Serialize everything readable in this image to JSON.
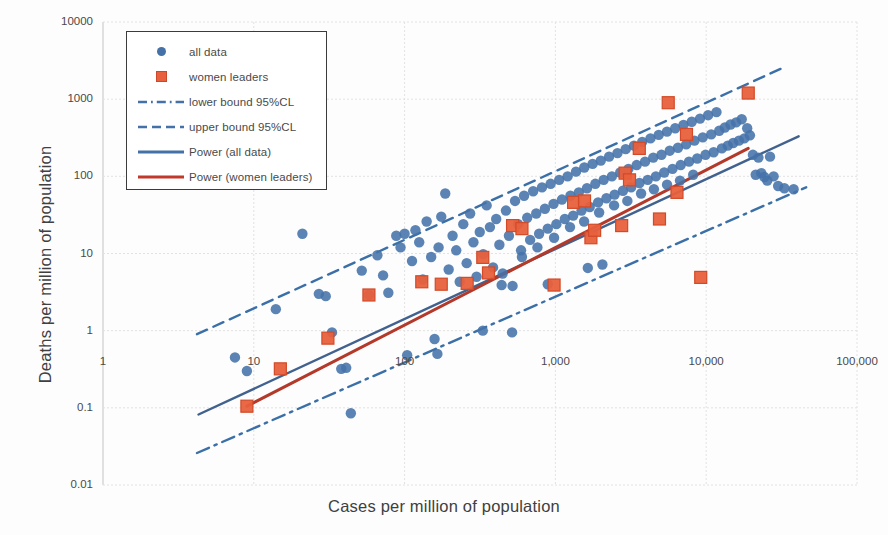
{
  "chart_data": {
    "type": "scatter",
    "title": "",
    "xlabel": "Cases per million of population",
    "ylabel": "Deaths per million of population",
    "xscale": "log",
    "yscale": "log",
    "xlim": [
      1,
      100000
    ],
    "ylim": [
      0.01,
      10000
    ],
    "xticks": [
      "1",
      "10",
      "100",
      "1,000",
      "10,000",
      "100,000"
    ],
    "yticks": [
      "10000",
      "1000",
      "100",
      "10",
      "1",
      "0.1",
      "0.01"
    ],
    "grid": true,
    "legend_position": "top-left",
    "series": [
      {
        "name": "all data",
        "type": "scatter",
        "marker": "circle",
        "color": "#4472a8",
        "points": [
          [
            7.5,
            0.45
          ],
          [
            9,
            0.3
          ],
          [
            14,
            1.9
          ],
          [
            21,
            18
          ],
          [
            27,
            3.0
          ],
          [
            30,
            2.8
          ],
          [
            33,
            0.95
          ],
          [
            38,
            0.32
          ],
          [
            41,
            0.33
          ],
          [
            44,
            0.085
          ],
          [
            52,
            6.0
          ],
          [
            58,
            2.9
          ],
          [
            66,
            9.5
          ],
          [
            72,
            5.2
          ],
          [
            78,
            3.1
          ],
          [
            88,
            17
          ],
          [
            94,
            12
          ],
          [
            100,
            18
          ],
          [
            104,
            0.48
          ],
          [
            112,
            8.0
          ],
          [
            118,
            20
          ],
          [
            125,
            14
          ],
          [
            132,
            4.6
          ],
          [
            140,
            26
          ],
          [
            150,
            9.0
          ],
          [
            158,
            0.78
          ],
          [
            168,
            12
          ],
          [
            175,
            30
          ],
          [
            186,
            60
          ],
          [
            196,
            6.2
          ],
          [
            208,
            17
          ],
          [
            220,
            11
          ],
          [
            232,
            4.3
          ],
          [
            245,
            24
          ],
          [
            258,
            7.5
          ],
          [
            272,
            33
          ],
          [
            286,
            14
          ],
          [
            300,
            5.0
          ],
          [
            315,
            19
          ],
          [
            332,
            9.8
          ],
          [
            350,
            42
          ],
          [
            368,
            22
          ],
          [
            386,
            6.6
          ],
          [
            405,
            28
          ],
          [
            425,
            13
          ],
          [
            447,
            5.5
          ],
          [
            470,
            36
          ],
          [
            492,
            17
          ],
          [
            516,
            0.95
          ],
          [
            540,
            48
          ],
          [
            566,
            24
          ],
          [
            592,
            11
          ],
          [
            620,
            56
          ],
          [
            650,
            29
          ],
          [
            680,
            15
          ],
          [
            712,
            64
          ],
          [
            746,
            33
          ],
          [
            780,
            18
          ],
          [
            815,
            72
          ],
          [
            852,
            38
          ],
          [
            890,
            21
          ],
          [
            930,
            80
          ],
          [
            972,
            44
          ],
          [
            1015,
            24
          ],
          [
            1060,
            90
          ],
          [
            1105,
            50
          ],
          [
            1155,
            28
          ],
          [
            1205,
            100
          ],
          [
            1258,
            56
          ],
          [
            1312,
            31
          ],
          [
            1370,
            115
          ],
          [
            1430,
            62
          ],
          [
            1490,
            36
          ],
          [
            1555,
            130
          ],
          [
            1620,
            70
          ],
          [
            1690,
            40
          ],
          [
            1765,
            145
          ],
          [
            1840,
            80
          ],
          [
            1920,
            46
          ],
          [
            2000,
            160
          ],
          [
            2090,
            90
          ],
          [
            2180,
            52
          ],
          [
            2270,
            180
          ],
          [
            2370,
            100
          ],
          [
            2470,
            58
          ],
          [
            2580,
            200
          ],
          [
            2690,
            112
          ],
          [
            2805,
            65
          ],
          [
            2925,
            225
          ],
          [
            3050,
            125
          ],
          [
            3180,
            72
          ],
          [
            3320,
            250
          ],
          [
            3460,
            140
          ],
          [
            3610,
            82
          ],
          [
            3765,
            280
          ],
          [
            3930,
            155
          ],
          [
            4095,
            90
          ],
          [
            4270,
            310
          ],
          [
            4455,
            175
          ],
          [
            4640,
            100
          ],
          [
            4845,
            345
          ],
          [
            5050,
            190
          ],
          [
            5270,
            112
          ],
          [
            5495,
            380
          ],
          [
            5730,
            215
          ],
          [
            5980,
            125
          ],
          [
            6230,
            420
          ],
          [
            6500,
            235
          ],
          [
            6775,
            140
          ],
          [
            7070,
            465
          ],
          [
            7370,
            260
          ],
          [
            7690,
            155
          ],
          [
            8020,
            510
          ],
          [
            8360,
            290
          ],
          [
            8720,
            170
          ],
          [
            9100,
            560
          ],
          [
            9490,
            320
          ],
          [
            9900,
            190
          ],
          [
            10300,
            620
          ],
          [
            10800,
            350
          ],
          [
            11200,
            205
          ],
          [
            11700,
            680
          ],
          [
            12200,
            390
          ],
          [
            12700,
            230
          ],
          [
            13300,
            430
          ],
          [
            13900,
            250
          ],
          [
            14500,
            470
          ],
          [
            15100,
            270
          ],
          [
            15800,
            500
          ],
          [
            16500,
            290
          ],
          [
            17200,
            550
          ],
          [
            17900,
            310
          ],
          [
            18700,
            420
          ],
          [
            19500,
            340
          ],
          [
            20400,
            190
          ],
          [
            21300,
            105
          ],
          [
            22200,
            175
          ],
          [
            23200,
            110
          ],
          [
            24300,
            98
          ],
          [
            25400,
            88
          ],
          [
            26500,
            180
          ],
          [
            28000,
            100
          ],
          [
            30000,
            75
          ],
          [
            33000,
            70
          ],
          [
            38000,
            68
          ],
          [
            440,
            3.9
          ],
          [
            520,
            3.8
          ],
          [
            890,
            4.0
          ],
          [
            1640,
            6.5
          ],
          [
            2050,
            7.2
          ],
          [
            330,
            1.0
          ],
          [
            165,
            0.5
          ],
          [
            600,
            9.0
          ],
          [
            760,
            12
          ],
          [
            980,
            16
          ],
          [
            1250,
            22
          ],
          [
            1550,
            26
          ],
          [
            1950,
            34
          ],
          [
            2450,
            42
          ],
          [
            3000,
            48
          ],
          [
            3700,
            60
          ],
          [
            4500,
            68
          ],
          [
            5500,
            78
          ],
          [
            6700,
            88
          ],
          [
            8200,
            105
          ]
        ]
      },
      {
        "name": "women leaders",
        "type": "scatter",
        "marker": "square",
        "color": "#e8603c",
        "points": [
          [
            9,
            0.105
          ],
          [
            15,
            0.32
          ],
          [
            31,
            0.8
          ],
          [
            58,
            2.9
          ],
          [
            130,
            4.3
          ],
          [
            175,
            4.0
          ],
          [
            260,
            4.1
          ],
          [
            330,
            8.9
          ],
          [
            360,
            5.6
          ],
          [
            520,
            23
          ],
          [
            600,
            21
          ],
          [
            980,
            3.9
          ],
          [
            1320,
            46
          ],
          [
            1560,
            48
          ],
          [
            1720,
            16
          ],
          [
            1820,
            20
          ],
          [
            2750,
            23
          ],
          [
            2900,
            110
          ],
          [
            3100,
            90
          ],
          [
            3600,
            230
          ],
          [
            4900,
            28
          ],
          [
            5600,
            900
          ],
          [
            6400,
            62
          ],
          [
            7400,
            350
          ],
          [
            9200,
            4.9
          ],
          [
            19000,
            1200
          ]
        ]
      }
    ],
    "lines": [
      {
        "name": "Power (all data)",
        "color": "#4472a8",
        "style": "solid"
      },
      {
        "name": "Power (women leaders)",
        "color": "#c0392b",
        "style": "solid"
      },
      {
        "name": "lower bound 95%CL",
        "color": "#4472a8",
        "style": "dashdot"
      },
      {
        "name": "upper bound 95%CL",
        "color": "#4472a8",
        "style": "dashed"
      }
    ]
  },
  "legend": {
    "items": [
      {
        "label": "all data",
        "key": "dot-marker",
        "color": "#4472a8"
      },
      {
        "label": "women leaders",
        "key": "square-marker",
        "color": "#e8603c"
      },
      {
        "label": "lower bound 95%CL",
        "key": "dashdot-line",
        "color": "#4472a8"
      },
      {
        "label": "upper bound 95%CL",
        "key": "dashed-line",
        "color": "#4472a8"
      },
      {
        "label": "Power (all data)",
        "key": "solid-line",
        "color": "#4472a8"
      },
      {
        "label": "Power (women leaders)",
        "key": "solid-line",
        "color": "#c0392b"
      }
    ]
  }
}
